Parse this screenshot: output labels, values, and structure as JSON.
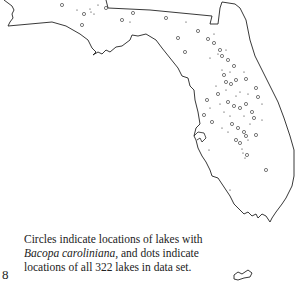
{
  "map": {
    "region": "Florida",
    "caption_part1": "Circles indicate locations of lakes with ",
    "caption_species": "Bacopa caroliniana,",
    "caption_part2": " and dots indicate locations of all 322 lakes in data set.",
    "total_lakes": 322,
    "legend": {
      "circle": "lakes with Bacopa caroliniana",
      "dot": "all lakes in data set"
    }
  },
  "page_number": "8"
}
